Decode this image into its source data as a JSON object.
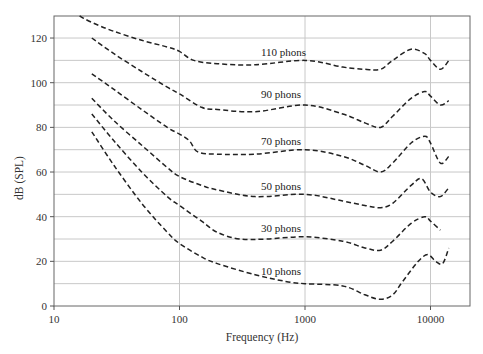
{
  "chart_data": {
    "type": "line",
    "title": "",
    "xlabel": "Frequency (Hz)",
    "ylabel": "dB (SPL)",
    "xscale": "log",
    "xlim": [
      10,
      16000
    ],
    "ylim": [
      0,
      130
    ],
    "x_ticks": [
      10,
      100,
      1000,
      10000
    ],
    "x_tick_labels": [
      "10",
      "100",
      "1000",
      "10000"
    ],
    "y_ticks": [
      0,
      20,
      40,
      60,
      80,
      100,
      120
    ],
    "y_tick_labels": [
      "0",
      "20",
      "40",
      "60",
      "80",
      "100",
      "120"
    ],
    "grid": {
      "horizontal_every_db": 10,
      "vertical_at": [
        100,
        1000,
        10000
      ]
    },
    "legend": "none (inline curve labels)",
    "line_style": "dashed",
    "series": [
      {
        "name": "110 phons",
        "label_at": [
          1000,
          113
        ],
        "x": [
          16,
          20,
          30,
          50,
          80,
          100,
          130,
          200,
          400,
          1000,
          2000,
          3000,
          4000,
          5000,
          7000,
          9000,
          10000,
          12000,
          14000
        ],
        "y": [
          130,
          127,
          123,
          119,
          116,
          114,
          110,
          108.5,
          108,
          110,
          107,
          106,
          106,
          110,
          115,
          113,
          110,
          106,
          110
        ]
      },
      {
        "name": "90 phons",
        "label_at": [
          1000,
          94
        ],
        "x": [
          20,
          30,
          50,
          80,
          100,
          150,
          200,
          400,
          1000,
          2000,
          3000,
          4000,
          5000,
          7000,
          9000,
          10000,
          12000,
          14000
        ],
        "y": [
          120,
          113,
          105,
          98,
          95,
          89,
          88,
          87,
          90,
          86,
          82,
          80,
          85,
          93,
          96,
          94,
          90,
          92
        ]
      },
      {
        "name": "70 phons",
        "label_at": [
          1000,
          73
        ],
        "x": [
          20,
          30,
          50,
          80,
          100,
          120,
          140,
          200,
          400,
          1000,
          2000,
          3000,
          4000,
          5000,
          7000,
          9000,
          10000,
          12000,
          14000
        ],
        "y": [
          104,
          97,
          88,
          80,
          77,
          74,
          69,
          68,
          68,
          70,
          67,
          63,
          60,
          64,
          73,
          76,
          73,
          64,
          67
        ]
      },
      {
        "name": "50 phons",
        "label_at": [
          1000,
          53
        ],
        "x": [
          20,
          30,
          50,
          80,
          100,
          150,
          200,
          400,
          1000,
          2000,
          3000,
          4000,
          5000,
          7000,
          8500,
          10000,
          12000,
          14000
        ],
        "y": [
          93,
          83,
          72,
          62,
          58,
          54,
          52,
          49,
          50,
          47,
          45,
          44,
          46,
          54,
          57,
          51,
          49,
          53
        ]
      },
      {
        "name": "30 phons",
        "label_at": [
          1000,
          34
        ],
        "x": [
          20,
          30,
          50,
          80,
          100,
          150,
          200,
          300,
          500,
          1000,
          2000,
          3000,
          4000,
          5000,
          7000,
          9000,
          10000,
          12000
        ],
        "y": [
          86,
          74,
          60,
          49,
          45,
          38,
          33,
          30,
          30,
          31,
          29,
          26,
          25,
          29,
          37,
          40,
          38,
          34
        ]
      },
      {
        "name": "10 phons",
        "label_at": [
          1000,
          15
        ],
        "x": [
          20,
          30,
          50,
          80,
          100,
          150,
          200,
          400,
          700,
          1000,
          2000,
          3000,
          4000,
          5000,
          6000,
          8000,
          9500,
          11000,
          12500,
          14000
        ],
        "y": [
          78,
          63,
          46,
          33,
          28,
          22,
          19,
          14,
          11,
          10,
          9,
          5,
          3,
          5,
          11,
          20,
          23,
          20,
          19,
          26
        ]
      }
    ]
  }
}
